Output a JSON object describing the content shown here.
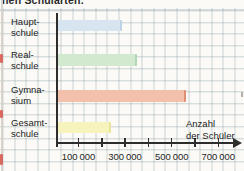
{
  "caption": {
    "visible_fragment": "nen Schularten."
  },
  "chart_data": {
    "type": "bar",
    "orientation": "horizontal",
    "title": "",
    "categories": [
      "Hauptschule",
      "Realschule",
      "Gymnasium",
      "Gesamtschule"
    ],
    "category_label_lines": [
      [
        "Haupt-",
        "schule"
      ],
      [
        "Real-",
        "schule"
      ],
      [
        "Gymna-",
        "sium"
      ],
      [
        "Gesamt-",
        "schule"
      ]
    ],
    "values": [
      270000,
      335000,
      545000,
      225000
    ],
    "unit": "Schüler",
    "xlabel": "Anzahl der Schüler",
    "xlabel_lines": [
      "Anzahl",
      "der Schüler"
    ],
    "x_ticks_labeled": [
      100000,
      300000,
      500000,
      700000
    ],
    "x_tick_labels": [
      "100 000",
      "300 000",
      "500 000",
      "700 000"
    ],
    "x_ticks_minor": [
      200000,
      400000,
      600000
    ],
    "xlim": [
      0,
      800000
    ],
    "grid": "graph-paper-background",
    "bar_colors": [
      "#d7e5f0",
      "#d2e9cf",
      "#f2c0ab",
      "#f6f3bd"
    ],
    "bar_edge_colors": [
      "#bcd3e6",
      "#b4d8b4",
      "#e08f72",
      "#e8e49a"
    ]
  },
  "colors": {
    "axis": "#2d2d2d",
    "grid_line": "#7d96a0",
    "paper": "#fbfaf6",
    "text": "#1a1a1a",
    "edge_mark_red": "#d96a5f"
  }
}
